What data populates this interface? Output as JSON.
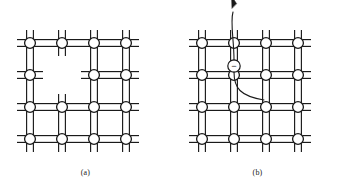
{
  "figure": {
    "type": "diagram",
    "background_color": "#ffffff",
    "line_color": "#1a1a1a",
    "atom_fill_color": "#ffffff",
    "width": 343,
    "height": 192
  },
  "panels": [
    {
      "id": "a",
      "caption": "(a)",
      "origin_x": 0,
      "defect_type": "vacancy",
      "lattice": {
        "columns": 4,
        "rows": 4,
        "spacing": 32,
        "first_atom_x": 30,
        "first_atom_y": 43,
        "atom_radius": 5.4,
        "bond_gap": 3.4,
        "stub_length": 13
      },
      "missing_atoms": [
        {
          "row": 1,
          "col": 1
        }
      ],
      "dangling_bond_stubs": [
        {
          "from_row": 0,
          "from_col": 1,
          "direction": "down"
        },
        {
          "from_row": 1,
          "from_col": 0,
          "direction": "right"
        },
        {
          "from_row": 1,
          "from_col": 2,
          "direction": "left"
        },
        {
          "from_row": 2,
          "from_col": 1,
          "direction": "up"
        }
      ],
      "electron": null,
      "arrow": null
    },
    {
      "id": "b",
      "caption": "(b)",
      "origin_x": 172,
      "defect_type": "free-electron",
      "lattice": {
        "columns": 4,
        "rows": 4,
        "spacing": 32,
        "first_atom_x": 30,
        "first_atom_y": 43,
        "atom_radius": 5.4,
        "bond_gap": 3.4,
        "stub_length": 13
      },
      "missing_atoms": [],
      "dangling_bond_stubs": [],
      "electron": {
        "label": "−",
        "symbol_name": "electron-charge-minus",
        "cx": 62,
        "cy": 66,
        "r": 6.2
      },
      "arrow": {
        "name": "electron-escape-arrow",
        "path": "M 62 72 C 62 88, 68 96, 92 100",
        "tail_path": "M 62 60 C 62 40, 58 22, 61 12",
        "head_x": 60,
        "head_y": 8,
        "head_angle": -108
      }
    }
  ]
}
